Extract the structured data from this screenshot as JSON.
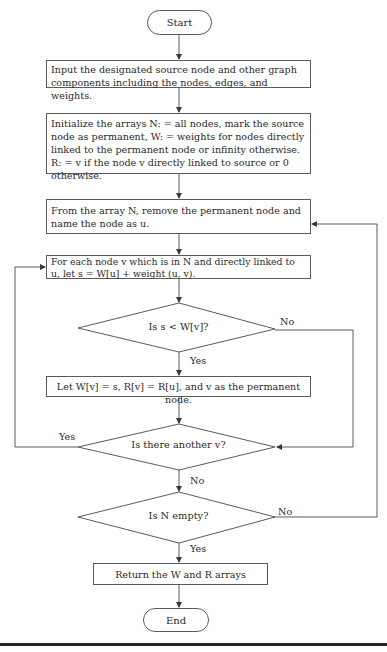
{
  "flowchart": {
    "start": {
      "label": "Start"
    },
    "end": {
      "label": "End"
    },
    "steps": [
      {
        "id": "input",
        "text": "Input the designated source node and other graph components including the nodes, edges, and weights."
      },
      {
        "id": "initialize",
        "text": "Initialize the arrays N: = all nodes, mark the source node as permanent, W: = weights for nodes directly linked to the permanent node or infinity otherwise. R: = v if the node v directly linked to source or 0 otherwise."
      },
      {
        "id": "remove",
        "text": "From the array N, remove the permanent node and name the node as u."
      },
      {
        "id": "for-each",
        "text": "For each node v which is in N and directly linked to u, let s = W[u] + weight (u, v)."
      },
      {
        "id": "update",
        "text": "Let W[v] = s, R[v] = R[u], and v as the permanent node."
      },
      {
        "id": "return",
        "text": "Return the W and R arrays"
      }
    ],
    "decisions": [
      {
        "id": "compare",
        "text": "Is s < W[v]?",
        "yes": "Yes",
        "no": "No"
      },
      {
        "id": "another",
        "text": "Is there another v?",
        "yes": "Yes",
        "no": "No"
      },
      {
        "id": "empty",
        "text": "Is N empty?",
        "yes": "Yes",
        "no": "No"
      }
    ]
  },
  "colors": {
    "line": "#5a5a5a",
    "text": "#2a2a2a",
    "rule": "#222222"
  }
}
